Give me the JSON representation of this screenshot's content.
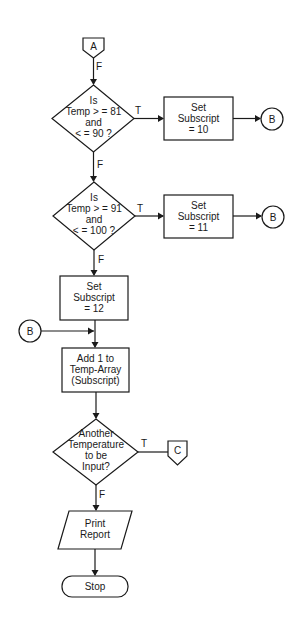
{
  "diagram": {
    "type": "flowchart",
    "connectors": {
      "start_A": "A",
      "end_C": "C",
      "b1": "B",
      "b2": "B",
      "b_in": "B"
    },
    "decision1": {
      "lines": [
        "Is",
        "Temp > = 81",
        "and",
        "< = 90 ?"
      ],
      "true_label": "T",
      "false_label": "F"
    },
    "process1": {
      "lines": [
        "Set",
        "Subscript",
        "= 10"
      ]
    },
    "decision2": {
      "lines": [
        "Is",
        "Temp > = 91",
        "and",
        "< = 100 ?"
      ],
      "true_label": "T",
      "false_label": "F"
    },
    "process2": {
      "lines": [
        "Set",
        "Subscript",
        "= 11"
      ]
    },
    "process3": {
      "lines": [
        "Set",
        "Subscript",
        "= 12"
      ]
    },
    "process4": {
      "lines": [
        "Add 1 to",
        "Temp-Array",
        "(Subscript)"
      ]
    },
    "decision3": {
      "lines": [
        "Another",
        "Temperature",
        "to be",
        "Input?"
      ],
      "true_label": "T",
      "false_label": "F"
    },
    "io1": {
      "lines": [
        "Print",
        "Report"
      ]
    },
    "terminal": {
      "label": "Stop"
    },
    "start_label": "F"
  }
}
